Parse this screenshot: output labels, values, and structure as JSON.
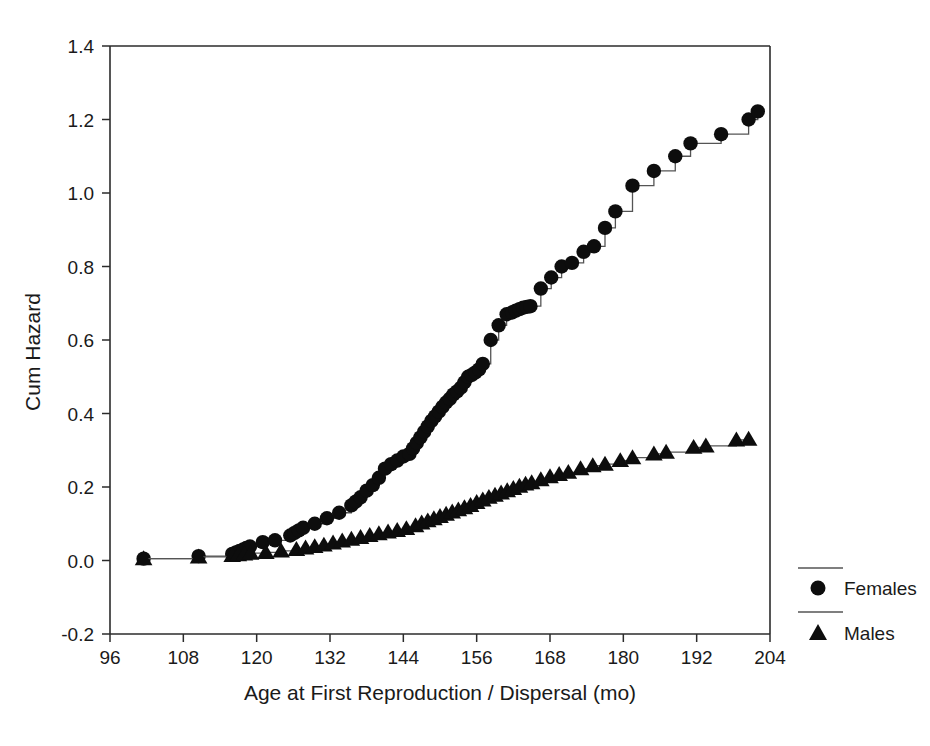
{
  "chart_data": {
    "type": "line",
    "title": "",
    "subtitle": "",
    "xlabel": "Age at First Reproduction / Dispersal (mo)",
    "ylabel": "Cum Hazard",
    "xlim": [
      96,
      204
    ],
    "ylim": [
      -0.2,
      1.4
    ],
    "xticks": [
      96,
      108,
      120,
      132,
      144,
      156,
      168,
      180,
      192,
      204
    ],
    "yticks": [
      -0.2,
      0.0,
      0.2,
      0.4,
      0.6,
      0.8,
      1.0,
      1.2,
      1.4
    ],
    "xtick_labels": [
      "96",
      "108",
      "120",
      "132",
      "144",
      "156",
      "168",
      "180",
      "192",
      "204"
    ],
    "ytick_labels": [
      "-0.2",
      "0.0",
      "0.2",
      "0.4",
      "0.6",
      "0.8",
      "1.0",
      "1.2",
      "1.4"
    ],
    "grid": false,
    "legend_position": "right",
    "step_style": "post",
    "series": [
      {
        "name": "Females",
        "marker": "circle",
        "marker_color": "#0d0d0d",
        "line_color": "#555555",
        "x": [
          101.5,
          110.5,
          116.0,
          116.6,
          117.2,
          117.8,
          118.3,
          118.9,
          121.0,
          123.0,
          125.5,
          126.2,
          126.9,
          127.6,
          129.5,
          131.5,
          133.5,
          135.5,
          136.2,
          137.0,
          138.0,
          139.0,
          140.0,
          141.0,
          142.0,
          143.0,
          144.0,
          145.0,
          145.6,
          146.2,
          146.8,
          147.4,
          148.0,
          148.6,
          149.2,
          149.8,
          150.4,
          151.0,
          151.6,
          152.2,
          152.8,
          153.4,
          154.0,
          154.6,
          155.2,
          155.8,
          156.4,
          157.0,
          158.3,
          159.6,
          160.9,
          161.8,
          162.4,
          163.0,
          163.6,
          164.2,
          164.8,
          166.5,
          168.2,
          169.9,
          171.6,
          173.5,
          175.2,
          177.0,
          178.7,
          181.5,
          185.0,
          188.5,
          191.0,
          196.0,
          200.5,
          202.0
        ],
        "y": [
          0.005,
          0.012,
          0.018,
          0.022,
          0.026,
          0.03,
          0.034,
          0.038,
          0.05,
          0.055,
          0.068,
          0.075,
          0.082,
          0.089,
          0.1,
          0.115,
          0.13,
          0.15,
          0.16,
          0.172,
          0.19,
          0.205,
          0.225,
          0.25,
          0.262,
          0.272,
          0.283,
          0.29,
          0.305,
          0.32,
          0.335,
          0.35,
          0.365,
          0.38,
          0.392,
          0.405,
          0.418,
          0.43,
          0.44,
          0.452,
          0.46,
          0.47,
          0.485,
          0.5,
          0.505,
          0.512,
          0.52,
          0.535,
          0.6,
          0.64,
          0.67,
          0.675,
          0.68,
          0.684,
          0.688,
          0.69,
          0.692,
          0.74,
          0.77,
          0.8,
          0.81,
          0.84,
          0.855,
          0.905,
          0.95,
          1.02,
          1.06,
          1.1,
          1.135,
          1.16,
          1.2,
          1.222
        ]
      },
      {
        "name": "Males",
        "marker": "triangle",
        "marker_color": "#0d0d0d",
        "line_color": "#555555",
        "x": [
          101.5,
          110.5,
          116.0,
          117.0,
          118.0,
          119.0,
          121.5,
          124.0,
          126.5,
          128.0,
          129.5,
          131.0,
          132.5,
          134.0,
          135.5,
          137.0,
          138.5,
          140.0,
          141.5,
          143.0,
          144.5,
          146.0,
          147.0,
          148.0,
          149.0,
          150.0,
          151.0,
          152.0,
          153.0,
          154.0,
          155.0,
          156.0,
          157.0,
          158.0,
          159.0,
          160.0,
          161.0,
          162.0,
          163.0,
          164.0,
          165.0,
          166.5,
          168.0,
          169.5,
          171.0,
          173.0,
          175.0,
          177.0,
          179.5,
          181.5,
          185.0,
          187.0,
          191.5,
          193.5,
          198.5,
          200.5
        ],
        "y": [
          0.005,
          0.01,
          0.014,
          0.016,
          0.018,
          0.02,
          0.022,
          0.026,
          0.03,
          0.034,
          0.038,
          0.042,
          0.048,
          0.053,
          0.058,
          0.063,
          0.068,
          0.073,
          0.078,
          0.082,
          0.087,
          0.095,
          0.102,
          0.108,
          0.114,
          0.12,
          0.126,
          0.132,
          0.138,
          0.144,
          0.15,
          0.158,
          0.165,
          0.172,
          0.178,
          0.184,
          0.19,
          0.196,
          0.202,
          0.208,
          0.212,
          0.22,
          0.228,
          0.234,
          0.24,
          0.25,
          0.258,
          0.262,
          0.272,
          0.28,
          0.29,
          0.295,
          0.308,
          0.312,
          0.328,
          0.33
        ]
      }
    ]
  },
  "legend": {
    "entries": [
      {
        "label": "Females",
        "marker": "circle"
      },
      {
        "label": "Males",
        "marker": "triangle"
      }
    ]
  },
  "axes": {
    "x_title": "Age at First Reproduction / Dispersal (mo)",
    "y_title": "Cum Hazard"
  }
}
